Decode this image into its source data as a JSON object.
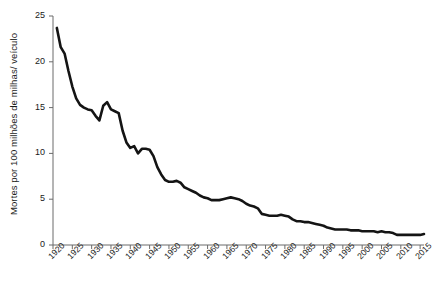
{
  "chart_data": {
    "type": "line",
    "title": "",
    "subtitle": "",
    "xlabel": "",
    "ylabel": "Mortes por 100 milhões de milhas/ veículo",
    "xlim": [
      1920,
      2016
    ],
    "ylim": [
      0,
      25
    ],
    "grid": false,
    "legend": null,
    "legend_position": "none",
    "y_ticks": [
      {
        "value": 25,
        "label": "25"
      },
      {
        "value": 20,
        "label": "20"
      },
      {
        "value": 15,
        "label": "15"
      },
      {
        "value": 10,
        "label": "10"
      },
      {
        "value": 5,
        "label": "5"
      },
      {
        "value": 0,
        "label": "0"
      }
    ],
    "x_ticks": [
      {
        "value": 1920,
        "label": "1920"
      },
      {
        "value": 1925,
        "label": "1925"
      },
      {
        "value": 1930,
        "label": "1930"
      },
      {
        "value": 1935,
        "label": "1935"
      },
      {
        "value": 1940,
        "label": "1940"
      },
      {
        "value": 1945,
        "label": "1945"
      },
      {
        "value": 1950,
        "label": "1950"
      },
      {
        "value": 1955,
        "label": "1955"
      },
      {
        "value": 1960,
        "label": "1960"
      },
      {
        "value": 1965,
        "label": "1965"
      },
      {
        "value": 1970,
        "label": "1970"
      },
      {
        "value": 1975,
        "label": "1975"
      },
      {
        "value": 1980,
        "label": "1980"
      },
      {
        "value": 1985,
        "label": "1985"
      },
      {
        "value": 1990,
        "label": "1990"
      },
      {
        "value": 1995,
        "label": "1995"
      },
      {
        "value": 2000,
        "label": "2000"
      },
      {
        "value": 2005,
        "label": "2005"
      },
      {
        "value": 2010,
        "label": "2010"
      },
      {
        "value": 2015,
        "label": "2015"
      }
    ],
    "x_minor_ticks_every": 5,
    "series": [
      {
        "name": "Mortes por 100 milhões de milhas/ veículo",
        "color": "#141414",
        "x": [
          1921,
          1922,
          1923,
          1924,
          1925,
          1926,
          1927,
          1928,
          1929,
          1930,
          1931,
          1932,
          1933,
          1934,
          1935,
          1936,
          1937,
          1938,
          1939,
          1940,
          1941,
          1942,
          1943,
          1944,
          1945,
          1946,
          1947,
          1948,
          1949,
          1950,
          1951,
          1952,
          1953,
          1954,
          1955,
          1956,
          1957,
          1958,
          1959,
          1960,
          1961,
          1962,
          1963,
          1964,
          1965,
          1966,
          1967,
          1968,
          1969,
          1970,
          1971,
          1972,
          1973,
          1974,
          1975,
          1976,
          1977,
          1978,
          1979,
          1980,
          1981,
          1982,
          1983,
          1984,
          1985,
          1986,
          1987,
          1988,
          1989,
          1990,
          1991,
          1992,
          1993,
          1994,
          1995,
          1996,
          1997,
          1998,
          1999,
          2000,
          2001,
          2002,
          2003,
          2004,
          2005,
          2006,
          2007,
          2008,
          2009,
          2010,
          2011,
          2012,
          2013,
          2014,
          2015,
          2016
        ],
        "y": [
          23.7,
          21.6,
          20.9,
          19.0,
          17.3,
          16.0,
          15.3,
          15.0,
          14.8,
          14.7,
          14.1,
          13.6,
          15.2,
          15.6,
          14.8,
          14.6,
          14.4,
          12.5,
          11.2,
          10.6,
          10.8,
          10.0,
          10.5,
          10.5,
          10.4,
          9.7,
          8.5,
          7.7,
          7.1,
          6.9,
          6.9,
          7.0,
          6.8,
          6.3,
          6.1,
          5.9,
          5.7,
          5.4,
          5.2,
          5.1,
          4.9,
          4.9,
          4.9,
          5.0,
          5.1,
          5.2,
          5.1,
          5.0,
          4.8,
          4.5,
          4.3,
          4.2,
          4.0,
          3.4,
          3.3,
          3.2,
          3.2,
          3.2,
          3.3,
          3.2,
          3.1,
          2.8,
          2.6,
          2.6,
          2.5,
          2.5,
          2.4,
          2.3,
          2.2,
          2.1,
          1.9,
          1.8,
          1.7,
          1.7,
          1.7,
          1.7,
          1.6,
          1.6,
          1.6,
          1.5,
          1.5,
          1.5,
          1.5,
          1.4,
          1.5,
          1.4,
          1.4,
          1.3,
          1.1,
          1.1,
          1.1,
          1.1,
          1.1,
          1.1,
          1.1,
          1.2
        ]
      }
    ],
    "annotations": []
  },
  "plot_geometry": {
    "x_axis_left_px": 53,
    "x_axis_right_px": 424,
    "y_axis_top_px": 16,
    "y_axis_bottom_px": 245
  }
}
